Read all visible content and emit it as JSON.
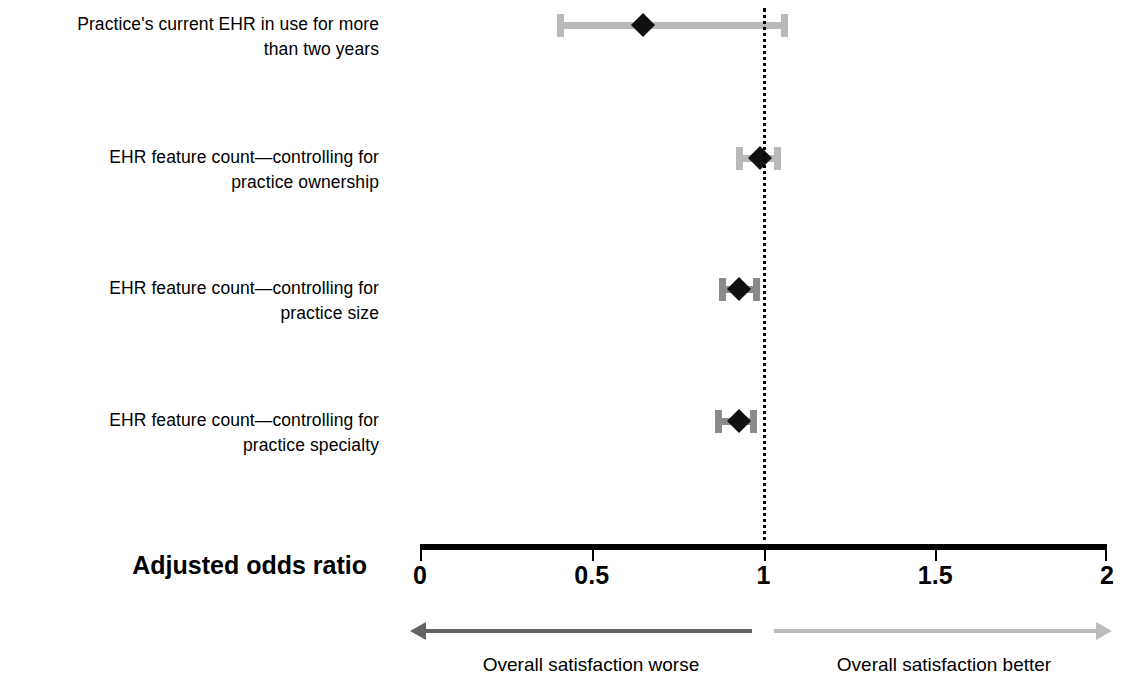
{
  "chart_data": {
    "type": "scatter",
    "subtype": "forest-plot",
    "title": "",
    "xlabel": "Adjusted odds ratio",
    "ylabel": "",
    "xlim": [
      0,
      2
    ],
    "xticks": [
      "0",
      "0.5",
      "1",
      "1.5",
      "2"
    ],
    "xtick_values": [
      0,
      0.5,
      1,
      1.5,
      2
    ],
    "grid": false,
    "legend": "none",
    "reference_line": 1,
    "categories": [
      "Practice's current EHR in use for more\nthan two years",
      "EHR feature count—controlling for\npractice ownership",
      "EHR feature count—controlling for\npractice size",
      "EHR feature count—controlling for\npractice specialty"
    ],
    "points": [
      {
        "label": "Practice's current EHR in use for more\nthan two years",
        "odds_ratio": 0.65,
        "ci_low": 0.4,
        "ci_high": 1.07,
        "bar_color": "#b9b9b9",
        "marker_color": "#111111"
      },
      {
        "label": "EHR feature count—controlling for\npractice ownership",
        "odds_ratio": 0.99,
        "ci_low": 0.92,
        "ci_high": 1.05,
        "bar_color": "#b9b9b9",
        "marker_color": "#111111"
      },
      {
        "label": "EHR feature count—controlling for\npractice size",
        "odds_ratio": 0.93,
        "ci_low": 0.87,
        "ci_high": 0.99,
        "bar_color": "#8a8a8a",
        "marker_color": "#111111"
      },
      {
        "label": "EHR feature count—controlling for\npractice specialty",
        "odds_ratio": 0.93,
        "ci_low": 0.86,
        "ci_high": 0.98,
        "bar_color": "#8a8a8a",
        "marker_color": "#111111"
      }
    ],
    "annotations": [
      {
        "text": "Overall satisfaction worse",
        "direction": "left",
        "color": "#636363"
      },
      {
        "text": "Overall satisfaction better",
        "direction": "right",
        "color": "#bcbcbc"
      }
    ]
  },
  "axis": {
    "title": "Adjusted odds ratio",
    "ticks": [
      "0",
      "0.5",
      "1",
      "1.5",
      "2"
    ]
  },
  "direction": {
    "left_label": "Overall satisfaction worse",
    "right_label": "Overall satisfaction better",
    "left_color": "#636363",
    "right_color": "#bcbcbc"
  },
  "layout": {
    "x_zero_px": 420,
    "x_two_px": 1107,
    "px_per_unit": 343.5,
    "row_y_px": [
      25,
      158,
      289,
      421
    ],
    "axis_y_px": 548,
    "label_right_px": 379
  }
}
